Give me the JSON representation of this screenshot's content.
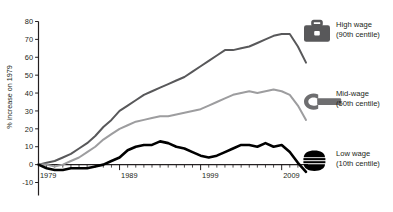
{
  "chart_data": {
    "type": "line",
    "title": "",
    "xlabel": "",
    "ylabel": "% increase on 1979",
    "xlim": [
      1979,
      2012
    ],
    "ylim": [
      -10,
      80
    ],
    "ytick_values": [
      -10,
      0,
      10,
      20,
      30,
      40,
      50,
      60,
      70,
      80
    ],
    "ytick_labels": [
      "-10",
      "0",
      "10",
      "20",
      "30",
      "40",
      "50",
      "60",
      "70",
      "80"
    ],
    "xtick_values": [
      1979,
      1989,
      1999,
      2009
    ],
    "xtick_labels": [
      "1979",
      "1989",
      "1999",
      "2009"
    ],
    "minor_xticks": true,
    "grid": false,
    "legend_position": "right",
    "x": [
      1979,
      1980,
      1981,
      1982,
      1983,
      1984,
      1985,
      1986,
      1987,
      1988,
      1989,
      1990,
      1991,
      1992,
      1993,
      1994,
      1995,
      1996,
      1997,
      1998,
      1999,
      2000,
      2001,
      2002,
      2003,
      2004,
      2005,
      2006,
      2007,
      2008,
      2009,
      2010,
      2011,
      2012
    ],
    "series": [
      {
        "name": "High wage (90th centile)",
        "short_name": "High wage",
        "centile": "(90th centile)",
        "color": "#58585a",
        "icon": "briefcase-icon",
        "values": [
          0,
          1,
          2,
          4,
          6,
          9,
          12,
          16,
          21,
          25,
          30,
          33,
          36,
          39,
          41,
          43,
          45,
          47,
          49,
          52,
          55,
          58,
          61,
          64,
          64,
          65,
          66,
          68,
          70,
          72,
          73,
          73,
          66,
          57
        ]
      },
      {
        "name": "Mid-wage (50th centile)",
        "short_name": "Mid-wage",
        "centile": "(50th centile)",
        "color": "#9d9d9f",
        "icon": "wrench-icon",
        "values": [
          0,
          0,
          -1,
          0,
          2,
          4,
          7,
          10,
          14,
          17,
          20,
          22,
          24,
          25,
          26,
          27,
          27,
          28,
          29,
          30,
          31,
          33,
          35,
          37,
          39,
          40,
          41,
          40,
          41,
          42,
          41,
          39,
          33,
          25
        ]
      },
      {
        "name": "Low wage (10th centile)",
        "short_name": "Low wage",
        "centile": "(10th centile)",
        "color": "#000000",
        "icon": "burger-icon",
        "values": [
          0,
          -2,
          -3,
          -3,
          -2,
          -2,
          -2,
          -1,
          0,
          2,
          4,
          8,
          10,
          11,
          11,
          13,
          12,
          10,
          9,
          7,
          5,
          4,
          5,
          7,
          9,
          11,
          11,
          10,
          12,
          10,
          11,
          7,
          1,
          -4
        ]
      }
    ]
  },
  "legend": {
    "items": [
      {
        "label": "High wage",
        "sub": "(90th centile)",
        "icon": "briefcase-icon",
        "color": "#58585a"
      },
      {
        "label": "Mid-wage",
        "sub": "(50th centile)",
        "icon": "wrench-icon",
        "color": "#6e6e70"
      },
      {
        "label": "Low wage",
        "sub": "(10th centile)",
        "icon": "burger-icon",
        "color": "#000000"
      }
    ]
  }
}
